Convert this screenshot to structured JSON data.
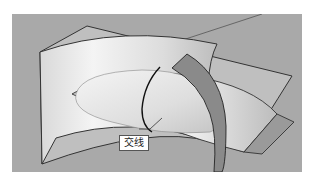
{
  "figure": {
    "background_color": "#a9a9a9",
    "surface_color": "#e8e8e8",
    "edge_color": "#333333"
  },
  "callout": {
    "label": "交线"
  }
}
